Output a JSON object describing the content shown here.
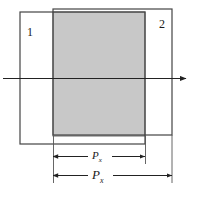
{
  "figure": {
    "type": "overlapping-rectangles-dimension-diagram",
    "background_color": "#ffffff",
    "stroke_color": "#333333",
    "overlap_fill_color": "#c8c8c8",
    "overlap_stroke_color": "#555555"
  },
  "shapes": {
    "rect1": {
      "label": "1",
      "x": 20,
      "y": 12,
      "width": 125,
      "height": 132,
      "stroke": "#444444",
      "fill": "none"
    },
    "rect2": {
      "label": "2",
      "x": 53,
      "y": 9,
      "width": 119,
      "height": 126,
      "stroke": "#444444",
      "fill": "none"
    },
    "overlap": {
      "x": 53,
      "y": 12,
      "width": 92,
      "height": 124,
      "fill": "#c8c8c8",
      "stroke": "#6b6b6b"
    }
  },
  "axis": {
    "name": "horizontal-axis-arrow",
    "x_start": 3,
    "x_end": 192,
    "y": 78,
    "stroke": "#222222",
    "arrowhead": "right"
  },
  "dimensions": [
    {
      "name": "inner-width-dimension",
      "label_base": "P",
      "label_subscript": "x",
      "x_start": 53,
      "x_end": 145,
      "y": 156,
      "font_size": 11,
      "subscript_font_size": 7
    },
    {
      "name": "outer-width-dimension",
      "label_base": "P",
      "label_subscript": "x",
      "x_start": 53,
      "x_end": 172,
      "y": 175,
      "font_size": 13,
      "subscript_font_size": 8
    }
  ],
  "extension_lines": [
    {
      "name": "ext-left",
      "x": 53,
      "y_start": 136,
      "y_end": 182
    },
    {
      "name": "ext-mid",
      "x": 145,
      "y_start": 136,
      "y_end": 163
    },
    {
      "name": "ext-right",
      "x": 172,
      "y_start": 135,
      "y_end": 182
    }
  ],
  "caption_fragment": {
    "text": "",
    "visible": false
  }
}
